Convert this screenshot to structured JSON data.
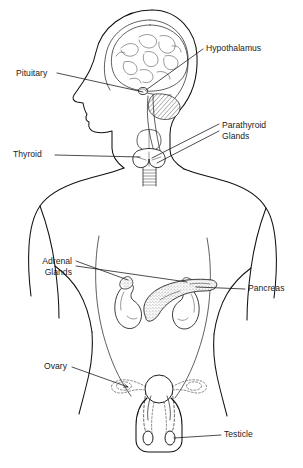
{
  "diagram": {
    "style": "black and white line drawing",
    "background_color": "#ffffff",
    "line_color": "#111111",
    "text_color": "#1b1b1b",
    "view": "anterior body with lateral head profile"
  },
  "labels": [
    {
      "id": "hypothalamus",
      "text": "Hypothalamus",
      "align": "start",
      "x": 206,
      "y": 51,
      "lines": [
        "Hypothalamus"
      ]
    },
    {
      "id": "pituitary",
      "text": "Pituitary",
      "align": "start",
      "x": 16,
      "y": 76,
      "lines": [
        "Pituitary"
      ]
    },
    {
      "id": "parathyroid-glands",
      "text": "Parathyroid Glands",
      "align": "start",
      "x": 222,
      "y": 128,
      "lines": [
        "Parathyroid",
        "Glands"
      ]
    },
    {
      "id": "thyroid",
      "text": "Thyroid",
      "align": "start",
      "x": 13,
      "y": 157,
      "lines": [
        "Thyroid"
      ]
    },
    {
      "id": "adrenal-glands",
      "text": "Adrenal Glands",
      "align": "end",
      "x": 72,
      "y": 264,
      "lines": [
        "Adrenal",
        "Glands"
      ]
    },
    {
      "id": "pancreas",
      "text": "Pancreas",
      "align": "start",
      "x": 248,
      "y": 291,
      "lines": [
        "Pancreas"
      ]
    },
    {
      "id": "ovary",
      "text": "Ovary",
      "align": "start",
      "x": 44,
      "y": 369,
      "lines": [
        "Ovary"
      ]
    },
    {
      "id": "testicle",
      "text": "Testicle",
      "align": "start",
      "x": 224,
      "y": 437,
      "lines": [
        "Testicle"
      ]
    }
  ],
  "organs": [
    {
      "id": "brain",
      "name": "brain",
      "note": "cerebrum with gyri, hatched cerebellum, brainstem"
    },
    {
      "id": "pituitary-gland",
      "name": "pituitary gland",
      "note": "small oval at base of brain"
    },
    {
      "id": "thyroid-gland",
      "name": "thyroid gland",
      "note": "butterfly gland on trachea below larynx"
    },
    {
      "id": "trachea",
      "name": "trachea",
      "note": "ridged tube below thyroid"
    },
    {
      "id": "kidney-left",
      "name": "left kidney",
      "note": "bean shape with adrenal cap"
    },
    {
      "id": "kidney-right",
      "name": "right kidney",
      "note": "bean shape with adrenal cap"
    },
    {
      "id": "pancreas-organ",
      "name": "pancreas",
      "note": "stippled elongated gland between kidneys"
    },
    {
      "id": "uterus",
      "name": "uterus",
      "note": "dashed female outline"
    },
    {
      "id": "ovary-organ",
      "name": "ovaries",
      "note": "dashed paired ovals on fallopian tubes"
    },
    {
      "id": "testicle-organ",
      "name": "testicles",
      "note": "solid paired ovals inside scrotum"
    }
  ]
}
